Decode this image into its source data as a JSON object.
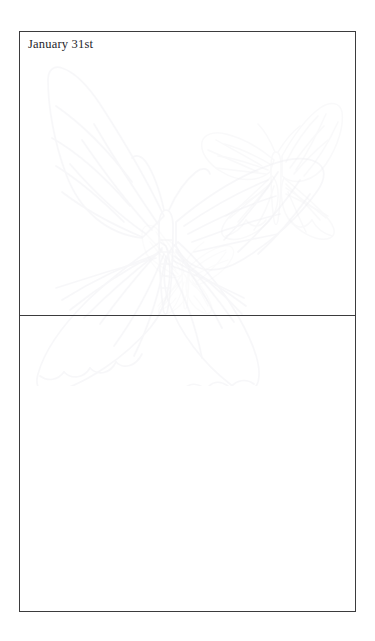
{
  "document": {
    "type": "journal-page",
    "title": "January 31st",
    "background_color": "#ffffff",
    "frame_color": "#3b3b3d",
    "text_color": "#24242a"
  },
  "page": {
    "entry": {
      "date_label": "January 31st",
      "note_text": "",
      "note_placeholder": ""
    },
    "lower_panel": {
      "note_text": "",
      "note_placeholder": ""
    }
  },
  "watermarks": [
    {
      "name": "butterfly-large",
      "label": "butterfly-watermark-icon",
      "size": "large",
      "color": "#f4f4f6"
    },
    {
      "name": "butterfly-medium",
      "label": "butterfly-watermark-icon",
      "size": "medium",
      "color": "#f4f4f6"
    },
    {
      "name": "butterfly-small",
      "label": "butterfly-watermark-icon",
      "size": "small",
      "color": "#f4f4f6"
    }
  ]
}
